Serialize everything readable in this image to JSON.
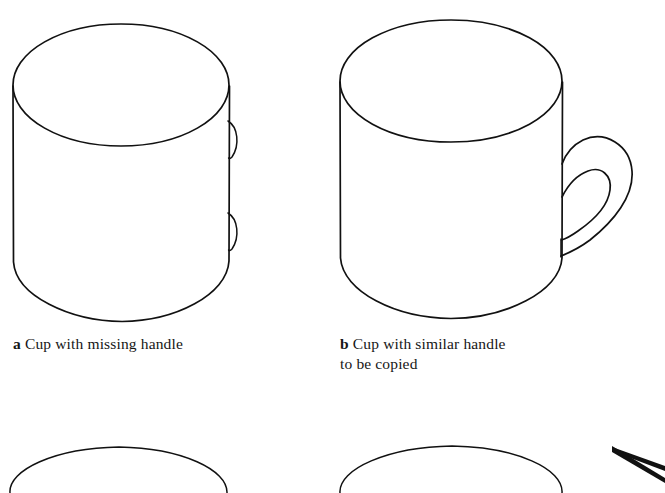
{
  "figure": {
    "background_color": "#ffffff",
    "ink_color": "#111111",
    "style": "line-drawing",
    "panels": [
      {
        "id": "a",
        "marker": "a",
        "caption": "Cup with missing handle",
        "caption_lines": [
          "Cup with missing handle"
        ],
        "subject": "cylindrical cup drawn in perspective with open top ellipse and two small handle attachment stubs on the right side, handle absent"
      },
      {
        "id": "b",
        "marker": "b",
        "caption": "Cup with similar handle to be copied",
        "caption_lines": [
          "Cup with similar handle",
          "to be copied"
        ],
        "subject": "cylindrical cup drawn in perspective with open top ellipse and a complete loop handle on the right side"
      }
    ],
    "bottom_row": {
      "description": "two partially cropped cup tops at the bottom edge of the image",
      "items": [
        "cropped cup top left",
        "cropped cup top right"
      ]
    },
    "annotations": [
      {
        "type": "arrow",
        "name": "copy-arrow",
        "direction": "points up-left",
        "label": ""
      }
    ]
  },
  "captions": {
    "a": {
      "marker": "a",
      "line1": "Cup with missing handle",
      "line2": ""
    },
    "b": {
      "marker": "b",
      "line1": "Cup with similar handle",
      "line2": "to be copied"
    }
  }
}
